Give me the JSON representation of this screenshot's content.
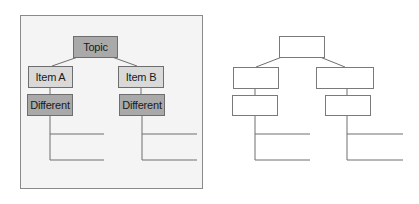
{
  "left_diagram": {
    "root": {
      "label": "Topic"
    },
    "branches": [
      {
        "item": {
          "label": "Item A"
        },
        "child": {
          "label": "Different"
        },
        "sub_lines": 2
      },
      {
        "item": {
          "label": "Item B"
        },
        "child": {
          "label": "Different"
        },
        "sub_lines": 2
      }
    ]
  },
  "right_diagram": {
    "root": {
      "label": ""
    },
    "branches": [
      {
        "item": {
          "label": ""
        },
        "child": {
          "label": ""
        },
        "sub_lines": 2
      },
      {
        "item": {
          "label": ""
        },
        "child": {
          "label": ""
        },
        "sub_lines": 2
      }
    ]
  },
  "colors": {
    "panel_bg": "#f4f4f4",
    "root_fill": "#a9a9a9",
    "item_fill": "#d9d9d9",
    "child_fill": "#a9a9a9",
    "line": "#6e6e6e"
  }
}
